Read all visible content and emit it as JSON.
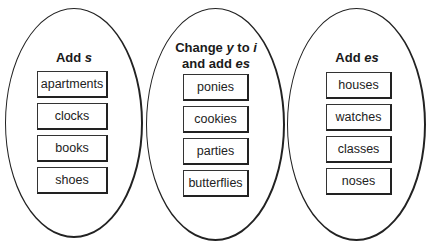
{
  "groups": [
    {
      "title_parts": [
        "Add ",
        "s"
      ],
      "items": [
        "apartments",
        "clocks",
        "books",
        "shoes"
      ]
    },
    {
      "title_parts": [
        "Change ",
        "y",
        " to ",
        "i",
        "and add ",
        "es"
      ],
      "items": [
        "ponies",
        "cookies",
        "parties",
        "butterflies"
      ]
    },
    {
      "title_parts": [
        "Add ",
        "es"
      ],
      "items": [
        "houses",
        "watches",
        "classes",
        "noses"
      ]
    }
  ]
}
